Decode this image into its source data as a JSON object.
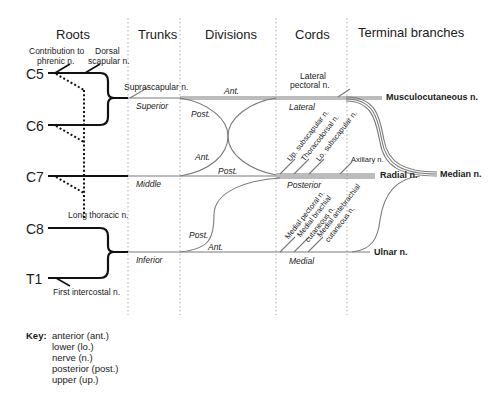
{
  "headers": {
    "roots": "Roots",
    "trunks": "Trunks",
    "divisions": "Divisions",
    "cords": "Cords",
    "terminal": "Terminal branches"
  },
  "roots": [
    "C5",
    "C6",
    "C7",
    "C8",
    "T1"
  ],
  "root_branches": {
    "phrenic_1": "Contribution to",
    "phrenic_2": "phrenic n.",
    "dorsal_1": "Dorsal",
    "dorsal_2": "scapular n.",
    "long_thoracic": "Long thoracic n.",
    "first_intercostal": "First intercostal n."
  },
  "trunks": {
    "suprascapular": "Suprascapular n.",
    "superior": "Superior",
    "middle": "Middle",
    "inferior": "Inferior"
  },
  "divisions": {
    "ant_top": "Ant.",
    "post_top": "Post.",
    "ant_mid": "Ant.",
    "post_mid": "Post.",
    "post_low": "Post.",
    "ant_low": "Ant."
  },
  "cords": {
    "lateral_pectoral_1": "Lateral",
    "lateral_pectoral_2": "pectoral n.",
    "lateral": "Lateral",
    "posterior": "Posterior",
    "medial": "Medial",
    "up_subscapular": "Up. subscapular n.",
    "thoracodorsal": "Thoracodorsal n.",
    "lo_subscapular": "Lo. subscapular n.",
    "axillary": "Axillary n.",
    "medial_pectoral": "Medial pectoral n.",
    "medial_brachial_1": "Medial brachial",
    "medial_brachial_2": "cutaneous n.",
    "medial_antebrachial_1": "Medial antebrachial",
    "medial_antebrachial_2": "cutaneous n."
  },
  "terminal": {
    "musculocutaneous": "Musculocutaneous n.",
    "radial": "Radial n.",
    "median": "Median n.",
    "ulnar": "Ulnar n."
  },
  "key": {
    "label": "Key:",
    "items": [
      "anterior (ant.)",
      "lower (lo.)",
      "nerve (n.)",
      "posterior (post.)",
      "upper (up.)"
    ]
  },
  "colors": {
    "root_line": "#111111",
    "nerve_line": "#7a7a7a",
    "divider": "#9a9a9a"
  }
}
